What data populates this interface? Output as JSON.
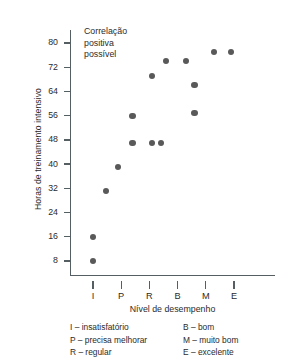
{
  "chart_data": {
    "type": "scatter",
    "title": "",
    "annotation": "Correlação\npositiva\npossível",
    "xlabel": "Nível de desempenho",
    "ylabel": "Horas de treinamento intensivo",
    "categories": [
      "I",
      "P",
      "R",
      "B",
      "M",
      "E"
    ],
    "yticks": [
      8,
      16,
      24,
      32,
      40,
      48,
      56,
      64,
      72,
      80
    ],
    "ylim": [
      0,
      84
    ],
    "grid": false,
    "legend_position": "below-axis",
    "point_color": "#595959",
    "axis_color": "#555e63",
    "points": [
      {
        "x": 1.0,
        "y": 8,
        "xlabel": "I"
      },
      {
        "x": 1.0,
        "y": 16,
        "xlabel": "I"
      },
      {
        "x": 1.45,
        "y": 31,
        "xlabel": "P"
      },
      {
        "x": 1.9,
        "y": 39,
        "xlabel": "P"
      },
      {
        "x": 2.4,
        "y": 47,
        "xlabel": "R"
      },
      {
        "x": 2.4,
        "y": 56,
        "xlabel": "R"
      },
      {
        "x": 3.1,
        "y": 47,
        "xlabel": "R"
      },
      {
        "x": 3.4,
        "y": 47,
        "xlabel": "B"
      },
      {
        "x": 3.1,
        "y": 69,
        "xlabel": "R"
      },
      {
        "x": 3.6,
        "y": 74,
        "xlabel": "B"
      },
      {
        "x": 4.3,
        "y": 74,
        "xlabel": "B"
      },
      {
        "x": 4.6,
        "y": 57,
        "xlabel": "M"
      },
      {
        "x": 4.6,
        "y": 66,
        "xlabel": "M"
      },
      {
        "x": 5.3,
        "y": 77,
        "xlabel": "M"
      },
      {
        "x": 5.9,
        "y": 77,
        "xlabel": "E"
      }
    ],
    "legend": {
      "left": [
        "I – insatisfatório",
        "P – precisa melhorar",
        "R – regular"
      ],
      "right": [
        "B – bom",
        "M – muito bom",
        "E – excelente"
      ]
    }
  }
}
